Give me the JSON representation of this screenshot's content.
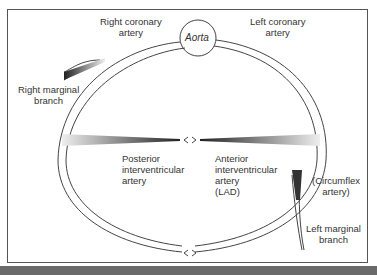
{
  "labels": {
    "aorta": "Aorta",
    "right_coronary": "Right coronary\nartery",
    "left_coronary": "Left coronary\nartery",
    "right_marginal": "Right marginal\nbranch",
    "posterior_iv": "Posterior\ninterventricular\nartery",
    "anterior_iv": "Anterior\ninterventricular\nartery\n(LAD)",
    "circumflex": "(Circumflex\nartery)",
    "left_marginal": "Left marginal\nbranch"
  },
  "colors": {
    "line": "#444444",
    "frame": "#555555",
    "bottom_bar": "#6a6a6a"
  }
}
